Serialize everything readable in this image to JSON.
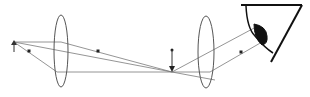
{
  "diagram": {
    "type": "optical ray diagram - compound microscope / telescope with eye",
    "colors": {
      "background": "#ffffff",
      "line": "#555555",
      "ray": "#777777",
      "dark": "#111111"
    },
    "object_arrow": {
      "x": 14,
      "y_base": 52,
      "y_tip": 42,
      "direction": "up"
    },
    "objective_lens": {
      "cx": 61,
      "cy": 51,
      "rx": 7,
      "ry": 36
    },
    "eyepiece_lens": {
      "cx": 206,
      "cy": 52,
      "rx": 8,
      "ry": 36
    },
    "focal_points": [
      {
        "x": 29,
        "y": 51
      },
      {
        "x": 98,
        "y": 51
      },
      {
        "x": 241,
        "y": 52
      }
    ],
    "image_arrow": {
      "x": 172,
      "y_base": 50,
      "y_tip": 72,
      "direction": "down"
    },
    "eye": {
      "label": "eye"
    }
  }
}
